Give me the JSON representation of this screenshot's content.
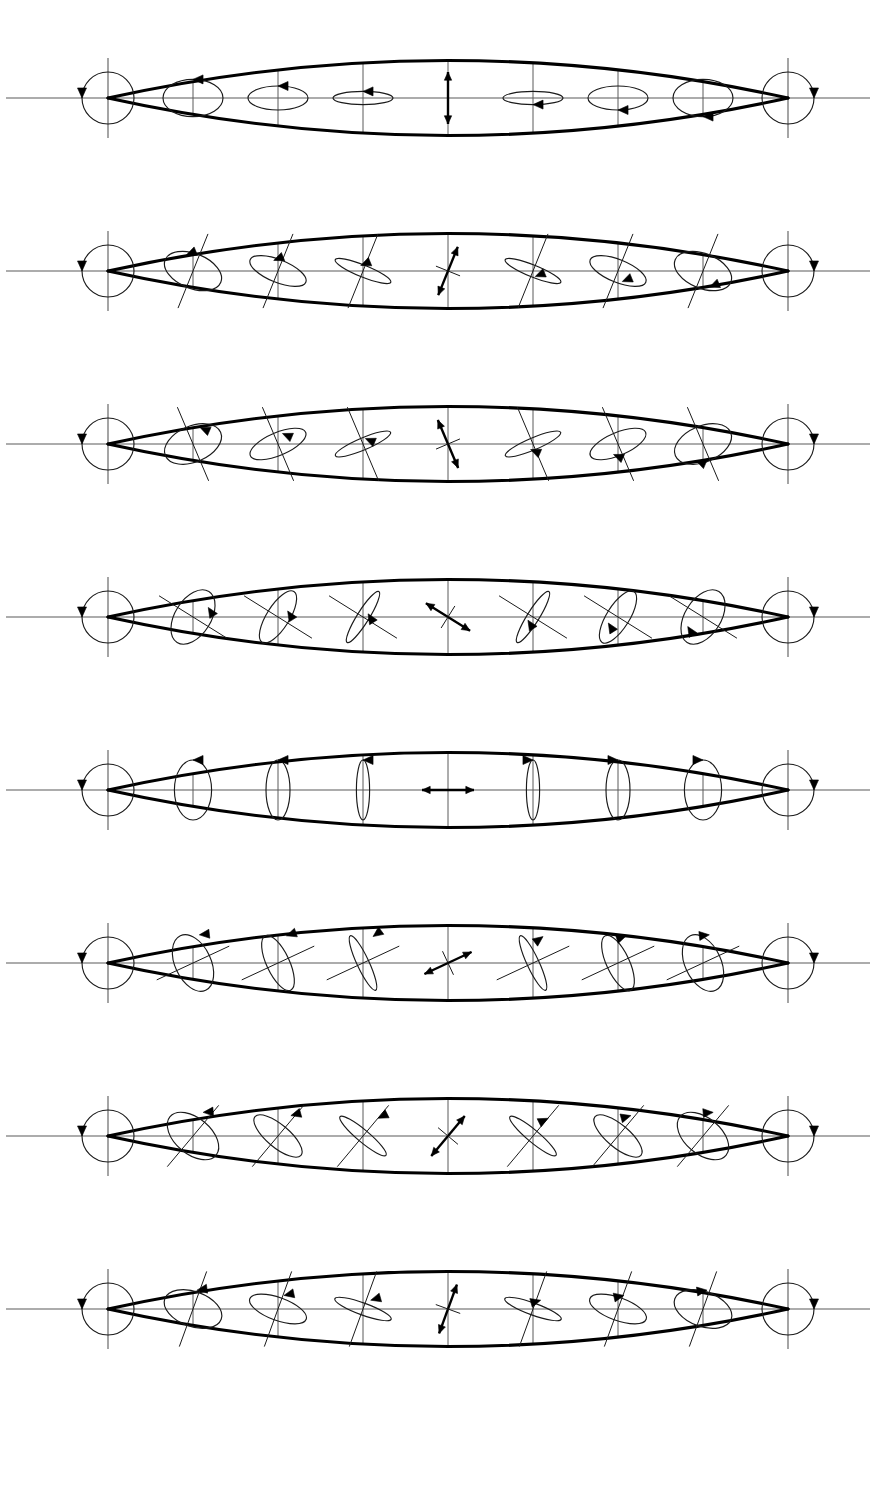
{
  "figure": {
    "width": 876,
    "height": 1500,
    "background_color": "#ffffff",
    "envelope_color": "#000000",
    "ellipse_color": "#1a1a1a",
    "axis_color": "#5a5a5a",
    "arrow_color": "#000000"
  },
  "geometry": {
    "row_count": 8,
    "row_height": 173,
    "row_top_offset": 12,
    "axis_y": 86,
    "tip_left_x": 108,
    "tip_right_x": 788,
    "lens_half_height": 56,
    "station_count": 9,
    "station_x": [
      108,
      193,
      278,
      363,
      448,
      533,
      618,
      703,
      788
    ],
    "endpoint_circle_radius": 26,
    "tick_half_height": 40
  },
  "chart_data": {
    "type": "line",
    "xlabel": "",
    "ylabel": "",
    "x": [
      -1.0,
      -0.75,
      -0.5,
      -0.25,
      0.0,
      0.25,
      0.5,
      0.75,
      1.0
    ],
    "legend": [
      "circular (left-handed)",
      "elliptical",
      "linear",
      "elliptical",
      "circular (right-handed)"
    ],
    "ellipticity_profile": [
      1.0,
      0.62,
      0.4,
      0.2,
      0.0,
      0.2,
      0.4,
      0.62,
      1.0
    ],
    "handedness": [
      "cw",
      "cw",
      "cw",
      "cw",
      "none",
      "ccw",
      "ccw",
      "ccw",
      "ccw"
    ],
    "series": [
      {
        "name": "Row 1",
        "azimuth_deg": 90,
        "values": [
          1.0,
          0.62,
          0.4,
          0.2,
          0.0,
          0.2,
          0.4,
          0.62,
          1.0
        ]
      },
      {
        "name": "Row 2",
        "azimuth_deg": 67.5,
        "values": [
          1.0,
          0.62,
          0.4,
          0.2,
          0.0,
          0.2,
          0.4,
          0.62,
          1.0
        ]
      },
      {
        "name": "Row 3",
        "azimuth_deg": 112.5,
        "values": [
          1.0,
          0.62,
          0.4,
          0.2,
          0.0,
          0.2,
          0.4,
          0.62,
          1.0
        ]
      },
      {
        "name": "Row 4",
        "azimuth_deg": 135,
        "values": [
          1.0,
          0.62,
          0.4,
          0.2,
          0.0,
          0.2,
          0.4,
          0.62,
          1.0
        ]
      },
      {
        "name": "Row 5",
        "azimuth_deg": 0,
        "values": [
          1.0,
          0.62,
          0.4,
          0.2,
          0.0,
          0.2,
          0.4,
          0.62,
          1.0
        ]
      },
      {
        "name": "Row 6",
        "azimuth_deg": 25,
        "values": [
          1.0,
          0.62,
          0.4,
          0.2,
          0.0,
          0.2,
          0.4,
          0.62,
          1.0
        ]
      },
      {
        "name": "Row 7",
        "azimuth_deg": 50,
        "values": [
          1.0,
          0.62,
          0.4,
          0.2,
          0.0,
          0.2,
          0.4,
          0.62,
          1.0
        ]
      },
      {
        "name": "Row 8",
        "azimuth_deg": 70,
        "values": [
          1.0,
          0.62,
          0.4,
          0.2,
          0.0,
          0.2,
          0.4,
          0.62,
          1.0
        ]
      }
    ]
  },
  "rows": [
    {
      "index": 1,
      "name": "row-1",
      "azimuth_deg": 90,
      "show_axis_cross": false,
      "center_symbol": "linear-vertical",
      "stations": [
        {
          "kind": "circle",
          "ellipticity": 1.0,
          "handed": "cw",
          "arrow_at": 180
        },
        {
          "kind": "ellipse",
          "ellipticity": 0.62,
          "handed": "cw",
          "arrow_at": 180
        },
        {
          "kind": "ellipse",
          "ellipticity": 0.4,
          "handed": "cw",
          "arrow_at": 180
        },
        {
          "kind": "ellipse",
          "ellipticity": 0.22,
          "handed": "cw",
          "arrow_at": 180
        },
        {
          "kind": "linear",
          "ellipticity": 0.0,
          "handed": "none",
          "arrow_at": 0
        },
        {
          "kind": "ellipse",
          "ellipticity": 0.22,
          "handed": "ccw",
          "arrow_at": 0
        },
        {
          "kind": "ellipse",
          "ellipticity": 0.4,
          "handed": "ccw",
          "arrow_at": 0
        },
        {
          "kind": "ellipse",
          "ellipticity": 0.62,
          "handed": "ccw",
          "arrow_at": 0
        },
        {
          "kind": "circle",
          "ellipticity": 1.0,
          "handed": "ccw",
          "arrow_at": 0
        }
      ]
    },
    {
      "index": 2,
      "name": "row-2",
      "azimuth_deg": 68,
      "show_axis_cross": true,
      "center_symbol": "linear-tilted",
      "stations": [
        {
          "kind": "circle",
          "ellipticity": 1.0,
          "handed": "cw",
          "arrow_at": 180
        },
        {
          "kind": "ellipse",
          "ellipticity": 0.58,
          "handed": "cw",
          "arrow_at": 180
        },
        {
          "kind": "ellipse",
          "ellipticity": 0.38,
          "handed": "cw",
          "arrow_at": 180
        },
        {
          "kind": "ellipse",
          "ellipticity": 0.2,
          "handed": "cw",
          "arrow_at": 180
        },
        {
          "kind": "linear",
          "ellipticity": 0.0,
          "handed": "none",
          "arrow_at": 0
        },
        {
          "kind": "ellipse",
          "ellipticity": 0.2,
          "handed": "ccw",
          "arrow_at": 0
        },
        {
          "kind": "ellipse",
          "ellipticity": 0.38,
          "handed": "ccw",
          "arrow_at": 0
        },
        {
          "kind": "ellipse",
          "ellipticity": 0.58,
          "handed": "ccw",
          "arrow_at": 0
        },
        {
          "kind": "circle",
          "ellipticity": 1.0,
          "handed": "ccw",
          "arrow_at": 0
        }
      ]
    },
    {
      "index": 3,
      "name": "row-3",
      "azimuth_deg": 113,
      "show_axis_cross": true,
      "center_symbol": "linear-tilted",
      "stations": [
        {
          "kind": "circle",
          "ellipticity": 1.0,
          "handed": "cw",
          "arrow_at": 180
        },
        {
          "kind": "ellipse",
          "ellipticity": 0.6,
          "handed": "cw",
          "arrow_at": 180
        },
        {
          "kind": "ellipse",
          "ellipticity": 0.38,
          "handed": "cw",
          "arrow_at": 180
        },
        {
          "kind": "ellipse",
          "ellipticity": 0.2,
          "handed": "cw",
          "arrow_at": 180
        },
        {
          "kind": "linear",
          "ellipticity": 0.0,
          "handed": "none",
          "arrow_at": 0
        },
        {
          "kind": "ellipse",
          "ellipticity": 0.2,
          "handed": "ccw",
          "arrow_at": 0
        },
        {
          "kind": "ellipse",
          "ellipticity": 0.38,
          "handed": "ccw",
          "arrow_at": 0
        },
        {
          "kind": "ellipse",
          "ellipticity": 0.6,
          "handed": "ccw",
          "arrow_at": 0
        },
        {
          "kind": "circle",
          "ellipticity": 1.0,
          "handed": "ccw",
          "arrow_at": 0
        }
      ]
    },
    {
      "index": 4,
      "name": "row-4",
      "azimuth_deg": 148,
      "show_axis_cross": true,
      "center_symbol": "linear-tilted",
      "stations": [
        {
          "kind": "circle",
          "ellipticity": 1.0,
          "handed": "cw",
          "arrow_at": 180
        },
        {
          "kind": "ellipse",
          "ellipticity": 0.6,
          "handed": "cw",
          "arrow_at": 180
        },
        {
          "kind": "ellipse",
          "ellipticity": 0.38,
          "handed": "cw",
          "arrow_at": 180
        },
        {
          "kind": "ellipse",
          "ellipticity": 0.2,
          "handed": "cw",
          "arrow_at": 180
        },
        {
          "kind": "linear",
          "ellipticity": 0.0,
          "handed": "none",
          "arrow_at": 0
        },
        {
          "kind": "ellipse",
          "ellipticity": 0.2,
          "handed": "ccw",
          "arrow_at": 0
        },
        {
          "kind": "ellipse",
          "ellipticity": 0.38,
          "handed": "ccw",
          "arrow_at": 0
        },
        {
          "kind": "ellipse",
          "ellipticity": 0.6,
          "handed": "ccw",
          "arrow_at": 0
        },
        {
          "kind": "circle",
          "ellipticity": 1.0,
          "handed": "ccw",
          "arrow_at": 0
        }
      ]
    },
    {
      "index": 5,
      "name": "row-5",
      "azimuth_deg": 0,
      "show_axis_cross": false,
      "center_symbol": "linear-horizontal",
      "stations": [
        {
          "kind": "circle",
          "ellipticity": 1.0,
          "handed": "cw",
          "arrow_at": 180
        },
        {
          "kind": "ellipse",
          "ellipticity": 0.62,
          "handed": "cw",
          "arrow_at": 270
        },
        {
          "kind": "ellipse",
          "ellipticity": 0.4,
          "handed": "cw",
          "arrow_at": 270
        },
        {
          "kind": "ellipse",
          "ellipticity": 0.22,
          "handed": "cw",
          "arrow_at": 270
        },
        {
          "kind": "linear",
          "ellipticity": 0.0,
          "handed": "none",
          "arrow_at": 0
        },
        {
          "kind": "ellipse",
          "ellipticity": 0.22,
          "handed": "ccw",
          "arrow_at": 270
        },
        {
          "kind": "ellipse",
          "ellipticity": 0.4,
          "handed": "ccw",
          "arrow_at": 270
        },
        {
          "kind": "ellipse",
          "ellipticity": 0.62,
          "handed": "ccw",
          "arrow_at": 270
        },
        {
          "kind": "circle",
          "ellipticity": 1.0,
          "handed": "ccw",
          "arrow_at": 0
        }
      ]
    },
    {
      "index": 6,
      "name": "row-6",
      "azimuth_deg": 25,
      "show_axis_cross": true,
      "center_symbol": "linear-tilted",
      "stations": [
        {
          "kind": "circle",
          "ellipticity": 1.0,
          "handed": "cw",
          "arrow_at": 180
        },
        {
          "kind": "ellipse",
          "ellipticity": 0.6,
          "handed": "cw",
          "arrow_at": 250
        },
        {
          "kind": "ellipse",
          "ellipticity": 0.38,
          "handed": "cw",
          "arrow_at": 250
        },
        {
          "kind": "ellipse",
          "ellipticity": 0.2,
          "handed": "cw",
          "arrow_at": 250
        },
        {
          "kind": "linear",
          "ellipticity": 0.0,
          "handed": "none",
          "arrow_at": 0
        },
        {
          "kind": "ellipse",
          "ellipticity": 0.2,
          "handed": "ccw",
          "arrow_at": 250
        },
        {
          "kind": "ellipse",
          "ellipticity": 0.38,
          "handed": "ccw",
          "arrow_at": 250
        },
        {
          "kind": "ellipse",
          "ellipticity": 0.6,
          "handed": "ccw",
          "arrow_at": 250
        },
        {
          "kind": "circle",
          "ellipticity": 1.0,
          "handed": "ccw",
          "arrow_at": 0
        }
      ]
    },
    {
      "index": 7,
      "name": "row-7",
      "azimuth_deg": 50,
      "show_axis_cross": true,
      "center_symbol": "linear-tilted",
      "stations": [
        {
          "kind": "circle",
          "ellipticity": 1.0,
          "handed": "cw",
          "arrow_at": 180
        },
        {
          "kind": "ellipse",
          "ellipticity": 0.6,
          "handed": "cw",
          "arrow_at": 230
        },
        {
          "kind": "ellipse",
          "ellipticity": 0.38,
          "handed": "cw",
          "arrow_at": 230
        },
        {
          "kind": "ellipse",
          "ellipticity": 0.2,
          "handed": "cw",
          "arrow_at": 230
        },
        {
          "kind": "linear",
          "ellipticity": 0.0,
          "handed": "none",
          "arrow_at": 0
        },
        {
          "kind": "ellipse",
          "ellipticity": 0.2,
          "handed": "ccw",
          "arrow_at": 230
        },
        {
          "kind": "ellipse",
          "ellipticity": 0.38,
          "handed": "ccw",
          "arrow_at": 230
        },
        {
          "kind": "ellipse",
          "ellipticity": 0.6,
          "handed": "ccw",
          "arrow_at": 230
        },
        {
          "kind": "circle",
          "ellipticity": 1.0,
          "handed": "ccw",
          "arrow_at": 0
        }
      ]
    },
    {
      "index": 8,
      "name": "row-8",
      "azimuth_deg": 70,
      "show_axis_cross": true,
      "center_symbol": "linear-tilted",
      "stations": [
        {
          "kind": "circle",
          "ellipticity": 1.0,
          "handed": "cw",
          "arrow_at": 180
        },
        {
          "kind": "ellipse",
          "ellipticity": 0.58,
          "handed": "cw",
          "arrow_at": 200
        },
        {
          "kind": "ellipse",
          "ellipticity": 0.38,
          "handed": "cw",
          "arrow_at": 200
        },
        {
          "kind": "ellipse",
          "ellipticity": 0.2,
          "handed": "cw",
          "arrow_at": 200
        },
        {
          "kind": "linear",
          "ellipticity": 0.0,
          "handed": "none",
          "arrow_at": 0
        },
        {
          "kind": "ellipse",
          "ellipticity": 0.2,
          "handed": "ccw",
          "arrow_at": 200
        },
        {
          "kind": "ellipse",
          "ellipticity": 0.38,
          "handed": "ccw",
          "arrow_at": 200
        },
        {
          "kind": "ellipse",
          "ellipticity": 0.58,
          "handed": "ccw",
          "arrow_at": 200
        },
        {
          "kind": "circle",
          "ellipticity": 1.0,
          "handed": "ccw",
          "arrow_at": 0
        }
      ]
    }
  ]
}
